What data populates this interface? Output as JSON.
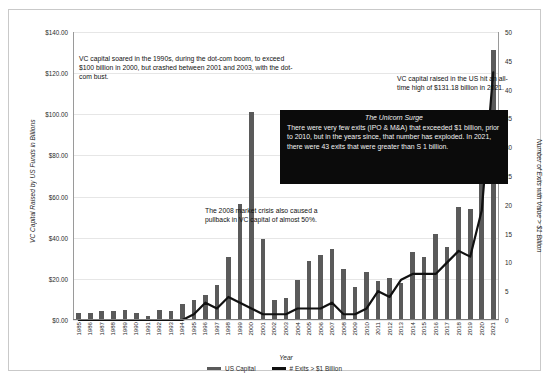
{
  "chart_data": {
    "type": "bar",
    "title": "",
    "xlabel": "Year",
    "ylabel": "VC Capital Raised by US Funds in Billions",
    "y2label": "Number of Exits with Value > $1 Billion",
    "grid": true,
    "legend_position": "bottom",
    "ylim": [
      0,
      140
    ],
    "y2lim": [
      0,
      50
    ],
    "ytick_labels": [
      "$0.00",
      "$20.00",
      "$40.00",
      "$60.00",
      "$80.00",
      "$100.00",
      "$120.00",
      "$140.00"
    ],
    "ytick_values": [
      0,
      20,
      40,
      60,
      80,
      100,
      120,
      140
    ],
    "y2tick_labels": [
      "0",
      "5",
      "10",
      "15",
      "20",
      "25",
      "30",
      "35",
      "40",
      "45",
      "50"
    ],
    "y2tick_values": [
      0,
      5,
      10,
      15,
      20,
      25,
      30,
      35,
      40,
      45,
      50
    ],
    "categories": [
      "1985",
      "1986",
      "1987",
      "1988",
      "1989",
      "1990",
      "1991",
      "1992",
      "1993",
      "1994",
      "1995",
      "1996",
      "1997",
      "1998",
      "1999",
      "2000",
      "2001",
      "2002",
      "2003",
      "2004",
      "2005",
      "2006",
      "2007",
      "2008",
      "2009",
      "2010",
      "2011",
      "2012",
      "2013",
      "2014",
      "2015",
      "2016",
      "2017",
      "2018",
      "2019",
      "2020",
      "2021"
    ],
    "series": [
      {
        "name": "US Capital",
        "type": "bar",
        "axis": "left",
        "color": "#5a5a5a",
        "values": [
          3.3,
          3.6,
          4.5,
          4.5,
          5.0,
          3.5,
          2.0,
          5.1,
          4.5,
          7.6,
          9.9,
          12.0,
          17.1,
          30.5,
          56.5,
          101.0,
          39.5,
          9.5,
          10.5,
          19.5,
          28.5,
          31.5,
          34.5,
          25.0,
          16.0,
          23.5,
          19.0,
          20.5,
          18.0,
          33.0,
          30.5,
          42.0,
          35.5,
          55.0,
          54.0,
          74.0,
          131.18
        ]
      },
      {
        "name": "# Exits > $1 Billion",
        "type": "line",
        "axis": "right",
        "color": "#111111",
        "values": [
          0,
          0,
          0,
          0,
          0,
          0,
          0,
          0,
          0,
          0,
          1,
          3,
          2,
          4,
          3,
          2,
          1,
          1,
          1,
          2,
          2,
          2,
          3,
          1,
          1,
          2,
          5,
          4,
          7,
          8,
          8,
          8,
          10,
          12,
          11,
          19,
          43
        ]
      }
    ],
    "annotations": [
      {
        "name": "dotcom-note",
        "text": "VC capital soared in the 1990s, during the dot-com boom, to exceed $100 billion in 2000, but crashed between 2001 and 2003, with the dot-com bust."
      },
      {
        "name": "all-time-high-note",
        "text": "VC capital raised in the US hit an all-time high of $131.18 billion in 2021."
      },
      {
        "name": "crisis-2008-note",
        "text": "The 2008 market crisis also caused a pullback in VC capital of almost 50%."
      }
    ],
    "callout_box": {
      "name": "unicorn-surge",
      "title": "The Unicorn Surge",
      "body": "There were very few exits (IPO & M&A) that exceeded $1 billion, prior to 2010, but in the years since, that number has exploded. In 2021, there were 43 exits that were greater than S 1 billion.",
      "background": "#0b0b0b",
      "text_color": "#f2f2f2"
    },
    "legend": [
      {
        "label": "US Capital",
        "color": "#5a5a5a"
      },
      {
        "label": "# Exits > $1 Billion",
        "color": "#111111"
      }
    ]
  }
}
